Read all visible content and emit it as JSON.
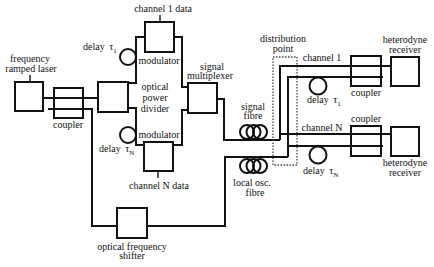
{
  "diagram": {
    "background": "#ffffff",
    "stroke_color": "#111111"
  },
  "transmitter": {
    "laser": {
      "label_lines": [
        "frequency",
        "ramped laser"
      ]
    },
    "coupler": {
      "label": "coupler"
    },
    "power_divider": {
      "label_lines": [
        "optical",
        "power",
        "divider"
      ]
    },
    "channels": [
      {
        "data_label": "channel 1 data",
        "modulator_label": "modulator",
        "delay": {
          "text": "delay",
          "symbol": "τ",
          "subscript": "1"
        }
      },
      {
        "data_label": "channel N data",
        "modulator_label": "modulator",
        "delay": {
          "text": "delay",
          "symbol": "τ",
          "subscript": "N"
        }
      }
    ],
    "multiplexer": {
      "label_lines": [
        "signal",
        "multiplexer"
      ]
    },
    "frequency_shifter": {
      "label_lines": [
        "optical frequency",
        "shifter"
      ]
    }
  },
  "link": {
    "signal_fibre": {
      "label_lines": [
        "signal",
        "fibre"
      ]
    },
    "local_osc_fibre": {
      "label_lines": [
        "local osc.",
        "fibre"
      ]
    },
    "distribution_point": {
      "label_lines": [
        "distribution",
        "point"
      ]
    }
  },
  "receivers": [
    {
      "channel_label": "channel 1",
      "coupler_label": "coupler",
      "delay": {
        "text": "delay",
        "symbol": "τ",
        "subscript": "1"
      },
      "receiver_label_lines": [
        "heterodyne",
        "receiver"
      ]
    },
    {
      "channel_label": "channel N",
      "coupler_label": "coupler",
      "delay": {
        "text": "delay",
        "symbol": "τ",
        "subscript": "N"
      },
      "receiver_label_lines": [
        "heterodyne",
        "receiver"
      ]
    }
  ]
}
